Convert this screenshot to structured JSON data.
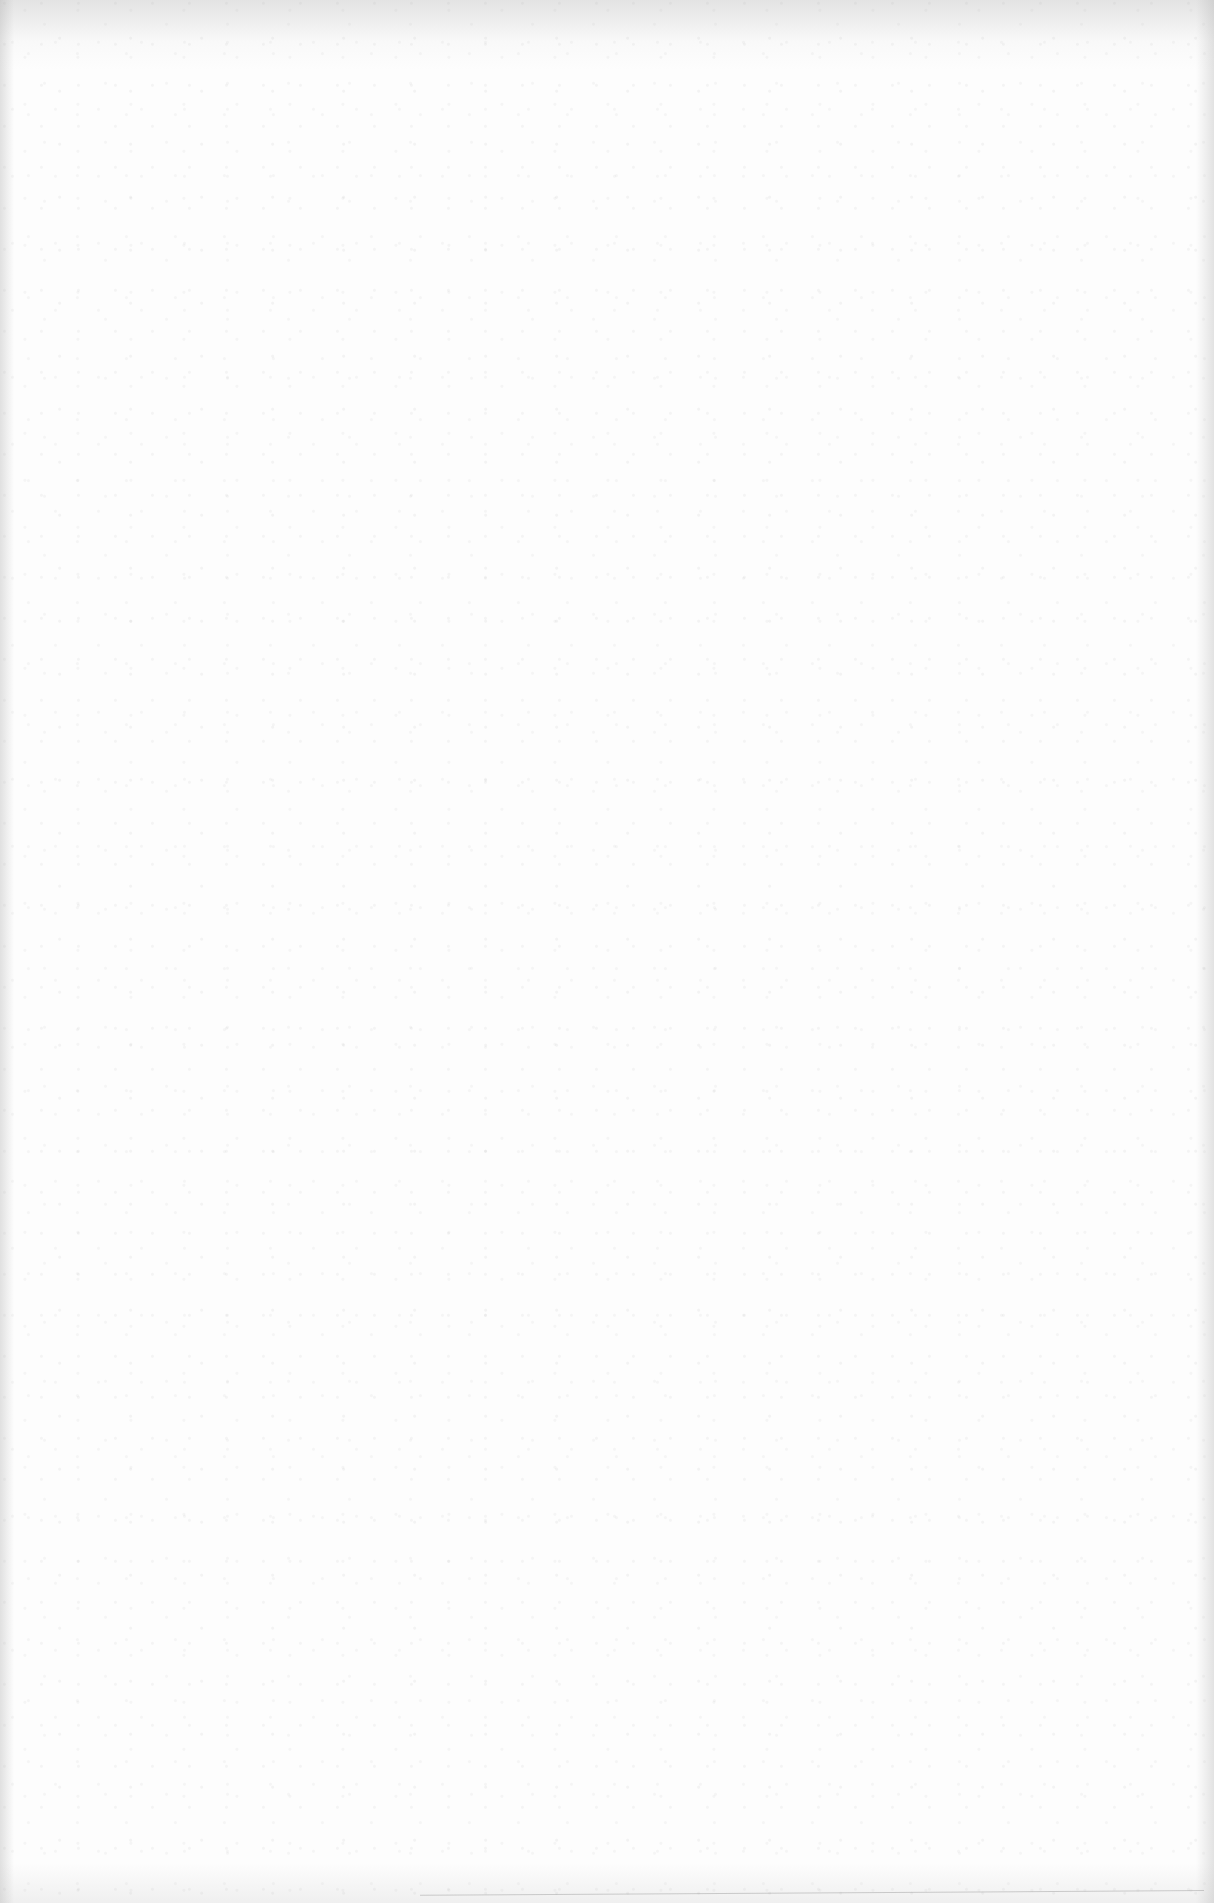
{
  "document": {
    "type": "blank-scanned-page",
    "text_content": "",
    "colors": {
      "paper": "#fdfdfd",
      "edge_shadow": "#a0a0a0"
    }
  }
}
